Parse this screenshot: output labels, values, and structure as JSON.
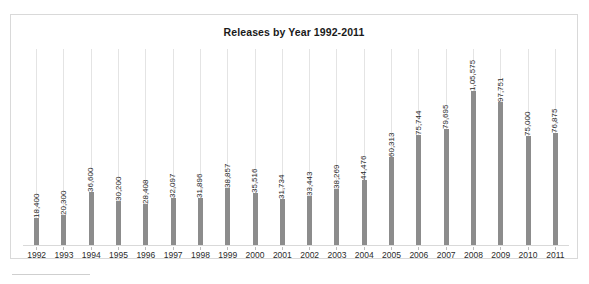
{
  "chart_data": {
    "type": "bar",
    "title": "Releases by Year 1992-2011",
    "xlabel": "",
    "ylabel": "",
    "grid": "vertical",
    "legend": "none",
    "ylim": [
      0,
      105575
    ],
    "categories": [
      "1992",
      "1993",
      "1994",
      "1995",
      "1996",
      "1997",
      "1998",
      "1999",
      "2000",
      "2001",
      "2002",
      "2003",
      "2004",
      "2005",
      "2006",
      "2007",
      "2008",
      "2009",
      "2010",
      "2011"
    ],
    "values": [
      18400,
      20300,
      36600,
      30200,
      28408,
      32097,
      31896,
      38857,
      35516,
      31734,
      33443,
      38269,
      44476,
      60313,
      75744,
      79695,
      105575,
      97751,
      75000,
      76875
    ],
    "data_labels": [
      "18,400",
      "20,300",
      "36,600",
      "30,200",
      "28,408",
      "32,097",
      "31,896",
      "38,857",
      "35,516",
      "31,734",
      "33,443",
      "38,269",
      "44,476",
      "60,313",
      "75,744",
      "79,695",
      "1,05,575",
      "97,751",
      "75,000",
      "76,875"
    ],
    "bar_color": "#8c8c8c",
    "gridline_color": "#e4e4e4",
    "border_color": "#d9d9d9"
  }
}
